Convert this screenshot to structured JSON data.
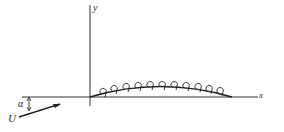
{
  "diagram": {
    "title": "",
    "axes": {
      "x_label": "x",
      "y_label": "y"
    },
    "freestream": {
      "velocity_label": "U",
      "angle_label": "α"
    },
    "airfoil": {
      "type": "thin cambered airfoil with bound vortex sheet",
      "vortex_count": 12
    },
    "colors": {
      "ink": "#2a2a2a",
      "background": "#ffffff"
    }
  }
}
